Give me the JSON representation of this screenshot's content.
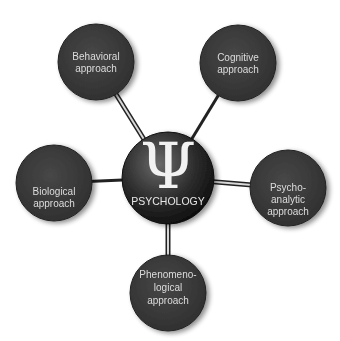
{
  "diagram": {
    "type": "hub-and-spoke",
    "center": {
      "symbol": "Ψ",
      "label": "PSYCHOLOGY",
      "icon": "psi-icon"
    },
    "nodes": [
      {
        "id": "behavioral",
        "lines": [
          "Behavioral",
          "approach"
        ]
      },
      {
        "id": "cognitive",
        "lines": [
          "Cognitive",
          "approach"
        ]
      },
      {
        "id": "biological",
        "lines": [
          "Biological",
          "approach"
        ]
      },
      {
        "id": "psychoanalytic",
        "lines": [
          "Psycho-",
          "analytic",
          "approach"
        ]
      },
      {
        "id": "phenomenological",
        "lines": [
          "Phenomeno-",
          "logical",
          "approach"
        ]
      }
    ],
    "colors": {
      "node_fill": "#3a3a3a",
      "text": "#dcdcdc",
      "connector": "#222222",
      "background": "#ffffff"
    }
  }
}
